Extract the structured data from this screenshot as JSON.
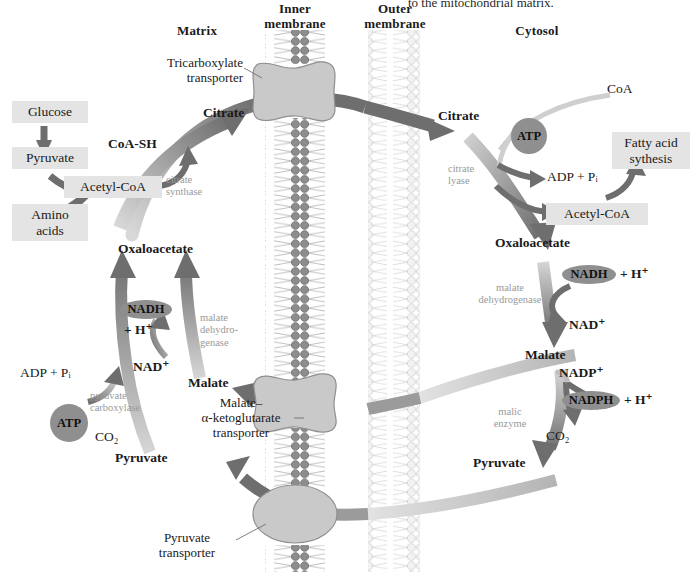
{
  "figure": {
    "type": "biochemical-pathway-diagram",
    "topic": "Transport of acetyl-CoA from the mitochondrion to the cytosol (citrate shuttle)",
    "caption_fragment": "to the mitochondrial matrix."
  },
  "compartments": {
    "matrix_label": "Matrix",
    "cytosol_label": "Cytosol",
    "inner_membrane_label": "Inner\nmembrane",
    "inner_membrane_line1": "Inner",
    "inner_membrane_line2": "membrane",
    "outer_membrane_line1": "Outer",
    "outer_membrane_line2": "membrane"
  },
  "transporters": [
    {
      "name": "tricarboxylate-transporter",
      "line1": "Tricarboxylate",
      "line2": "transporter"
    },
    {
      "name": "malate-alpha-ketoglutarate-transporter",
      "line1": "Malate–",
      "line2": "α-ketoglutarate",
      "line3": "transporter"
    },
    {
      "name": "pyruvate-transporter",
      "line1": "Pyruvate",
      "line2": "transporter"
    }
  ],
  "matrix": {
    "boxes": [
      {
        "name": "glucose-box",
        "label": "Glucose"
      },
      {
        "name": "pyruvate-box",
        "label": "Pyruvate"
      },
      {
        "name": "amino-acids-box",
        "label": "Amino\nacids",
        "line1": "Amino",
        "line2": "acids"
      },
      {
        "name": "acetyl-coa-box",
        "label": "Acetyl-CoA"
      }
    ],
    "metabolites": [
      {
        "name": "coa-sh",
        "label": "CoA-SH"
      },
      {
        "name": "citrate-matrix",
        "label": "Citrate"
      },
      {
        "name": "oxaloacetate-matrix",
        "label": "Oxaloacetate"
      },
      {
        "name": "malate-matrix",
        "label": "Malate"
      },
      {
        "name": "pyruvate-matrix",
        "label": "Pyruvate"
      }
    ],
    "cofactors": [
      {
        "name": "nadh-plus-h-matrix",
        "pill": "NADH",
        "suffix": "+ H⁺"
      },
      {
        "name": "nad-plus-matrix",
        "label": "NAD⁺"
      },
      {
        "name": "atp-matrix",
        "pill": "ATP"
      },
      {
        "name": "adp-pi-matrix",
        "label": "ADP + Pᵢ"
      },
      {
        "name": "co2-matrix",
        "label": "CO₂"
      }
    ],
    "enzymes": [
      {
        "name": "citrate-synthase",
        "line1": "citrate",
        "line2": "synthase"
      },
      {
        "name": "malate-dehydrogenase-matrix",
        "line1": "malate",
        "line2": "dehydro-",
        "line3": "genase"
      },
      {
        "name": "pyruvate-carboxylase",
        "line1": "pyruvate",
        "line2": "carboxylase"
      }
    ]
  },
  "cytosol": {
    "boxes": [
      {
        "name": "acetyl-coa-box-cytosol",
        "label": "Acetyl-CoA"
      },
      {
        "name": "fatty-acid-synthesis-box",
        "line1": "Fatty acid",
        "line2": "sythesis"
      }
    ],
    "metabolites": [
      {
        "name": "citrate-cytosol",
        "label": "Citrate"
      },
      {
        "name": "coa-cytosol",
        "label": "CoA"
      },
      {
        "name": "oxaloacetate-cytosol",
        "label": "Oxaloacetate"
      },
      {
        "name": "malate-cytosol",
        "label": "Malate"
      },
      {
        "name": "pyruvate-cytosol",
        "label": "Pyruvate"
      }
    ],
    "cofactors": [
      {
        "name": "atp-cytosol",
        "pill": "ATP"
      },
      {
        "name": "adp-pi-cytosol",
        "label": "ADP + Pᵢ"
      },
      {
        "name": "nadh-plus-h-cytosol",
        "pill": "NADH",
        "suffix": "+ H⁺"
      },
      {
        "name": "nad-plus-cytosol",
        "label": "NAD⁺"
      },
      {
        "name": "nadp-plus-cytosol",
        "label": "NADP⁺"
      },
      {
        "name": "nadph-plus-h-cytosol",
        "pill": "NADPH",
        "suffix": "+ H⁺"
      },
      {
        "name": "co2-cytosol",
        "label": "CO₂"
      }
    ],
    "enzymes": [
      {
        "name": "citrate-lyase",
        "line1": "citrate",
        "line2": "lyase"
      },
      {
        "name": "malate-dehydrogenase-cytosol",
        "line1": "malate",
        "line2": "dehydrogenase"
      },
      {
        "name": "malic-enzyme",
        "line1": "malic",
        "line2": "enzyme"
      }
    ]
  },
  "colors": {
    "arrow_dark": "#6e6e6e",
    "arrow_mid": "#9b9b9b",
    "arrow_light": "#d0d0d0",
    "box_fill": "#e4e4e4",
    "pill_fill": "#8f8f8f",
    "inner_membrane_head": "#8a8a8a",
    "outer_membrane_head": "#e0e0e0",
    "transporter_fill": "#c9c9c9",
    "enzyme_text": "#9a9a9a",
    "text": "#1a1a1a"
  }
}
